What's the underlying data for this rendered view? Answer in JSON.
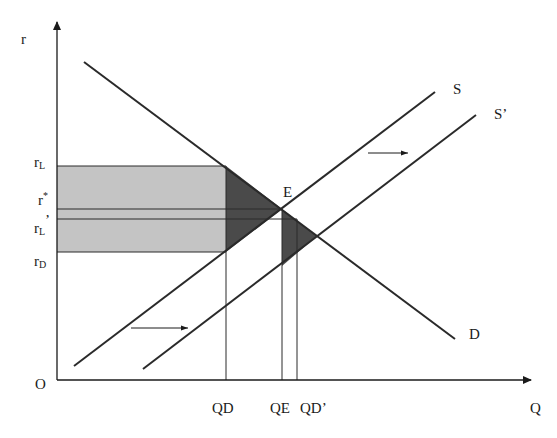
{
  "diagram": {
    "type": "supply-demand",
    "axes": {
      "y_label": "r",
      "x_label": "Q",
      "origin_label": "O"
    },
    "curves": {
      "demand": {
        "label": "D",
        "x1": 84,
        "y1": 62,
        "x2": 455,
        "y2": 339
      },
      "supply": {
        "label": "S",
        "x1": 74,
        "y1": 366,
        "x2": 435,
        "y2": 92
      },
      "supply_shifted": {
        "label": "S’",
        "x1": 143,
        "y1": 369,
        "x2": 476,
        "y2": 115
      }
    },
    "equilibrium_label": "E",
    "y_ticks": [
      {
        "base": "r",
        "sub": "L",
        "suffix": "",
        "y": 166
      },
      {
        "base": "r",
        "sub": "",
        "suffix": "*",
        "y": 209
      },
      {
        "base": "r",
        "sub": "L",
        "suffix": "’",
        "y": 219
      },
      {
        "base": "r",
        "sub": "D",
        "suffix": "",
        "y": 252
      }
    ],
    "x_ticks": [
      {
        "label": "QD",
        "x": 226
      },
      {
        "label": "QE",
        "x": 282
      },
      {
        "label": "QD’",
        "x": 297
      }
    ],
    "shift_arrows": [
      {
        "x1": 131,
        "x2": 188,
        "y": 328
      },
      {
        "x1": 368,
        "x2": 408,
        "y": 153
      }
    ],
    "colors": {
      "line": "#2a2a2a",
      "light_fill": "#c4c4c4",
      "dark_fill": "#4a4a4a"
    }
  }
}
